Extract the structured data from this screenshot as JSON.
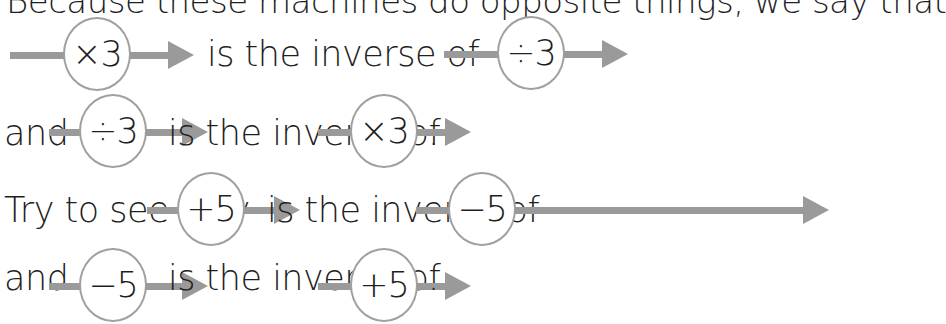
{
  "lines": [
    {
      "text": "Because these machines do opposite things, we say that"
    },
    {
      "m1": "×3",
      "t1": "is the inverse of",
      "m2": "÷3",
      "end": ""
    },
    {
      "lead": "and",
      "m1": "÷3",
      "t1": "is the inverse of",
      "m2": "×3",
      "end": "."
    },
    {
      "lead": "Try to see why",
      "m1": "+5",
      "t1": "is the inverse of",
      "m2": "−5",
      "end": ""
    },
    {
      "lead": "and",
      "m1": "−5",
      "t1": "is the inverse of",
      "m2": "+5",
      "end": "."
    }
  ],
  "colors": {
    "wire": "#9a9a9a",
    "circle_border": "#a0a0a0",
    "text": "#1f1f1f"
  }
}
